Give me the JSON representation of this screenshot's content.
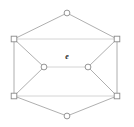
{
  "figure": {
    "type": "undirected-graph",
    "background_color": "#ffffff",
    "edge_color": "#9a9a9a",
    "faint_edge_color": "#c9c9c9",
    "node_stroke_color": "#8a8a8a",
    "node_fill_color": "#ffffff",
    "label_color": "#2b2b2b"
  },
  "chart_data": {
    "type": "diagram",
    "title": "",
    "xlabel": "",
    "ylabel": "",
    "nodes": [
      {
        "id": "top",
        "label": "",
        "shape": "circle",
        "x": 67,
        "y": 13
      },
      {
        "id": "upper-left",
        "label": "",
        "shape": "square",
        "x": 14,
        "y": 39
      },
      {
        "id": "upper-right",
        "label": "",
        "shape": "square",
        "x": 117,
        "y": 39
      },
      {
        "id": "center-left",
        "label": "",
        "shape": "circle",
        "x": 44,
        "y": 67
      },
      {
        "id": "center-right",
        "label": "",
        "shape": "circle",
        "x": 88,
        "y": 67
      },
      {
        "id": "lower-left",
        "label": "",
        "shape": "square",
        "x": 14,
        "y": 96
      },
      {
        "id": "lower-right",
        "label": "",
        "shape": "square",
        "x": 117,
        "y": 96
      },
      {
        "id": "bottom",
        "label": "",
        "shape": "circle",
        "x": 67,
        "y": 116
      }
    ],
    "edges": [
      {
        "from": "top",
        "to": "upper-left",
        "style": "solid",
        "label": ""
      },
      {
        "from": "top",
        "to": "upper-right",
        "style": "solid",
        "label": ""
      },
      {
        "from": "upper-left",
        "to": "upper-right",
        "style": "faint",
        "label": ""
      },
      {
        "from": "upper-left",
        "to": "center-left",
        "style": "solid",
        "label": ""
      },
      {
        "from": "upper-right",
        "to": "center-right",
        "style": "solid",
        "label": ""
      },
      {
        "from": "upper-left",
        "to": "lower-left",
        "style": "solid",
        "label": ""
      },
      {
        "from": "upper-right",
        "to": "lower-right",
        "style": "solid",
        "label": ""
      },
      {
        "from": "center-left",
        "to": "center-right",
        "style": "faint",
        "label": "e"
      },
      {
        "from": "center-left",
        "to": "lower-left",
        "style": "solid",
        "label": ""
      },
      {
        "from": "center-right",
        "to": "lower-right",
        "style": "solid",
        "label": ""
      },
      {
        "from": "lower-left",
        "to": "lower-right",
        "style": "faint",
        "label": ""
      },
      {
        "from": "lower-left",
        "to": "bottom",
        "style": "solid",
        "label": ""
      },
      {
        "from": "lower-right",
        "to": "bottom",
        "style": "solid",
        "label": ""
      }
    ],
    "labels": [
      {
        "id": "edge-label-e",
        "text": "e",
        "x": 67,
        "y": 57
      }
    ]
  }
}
